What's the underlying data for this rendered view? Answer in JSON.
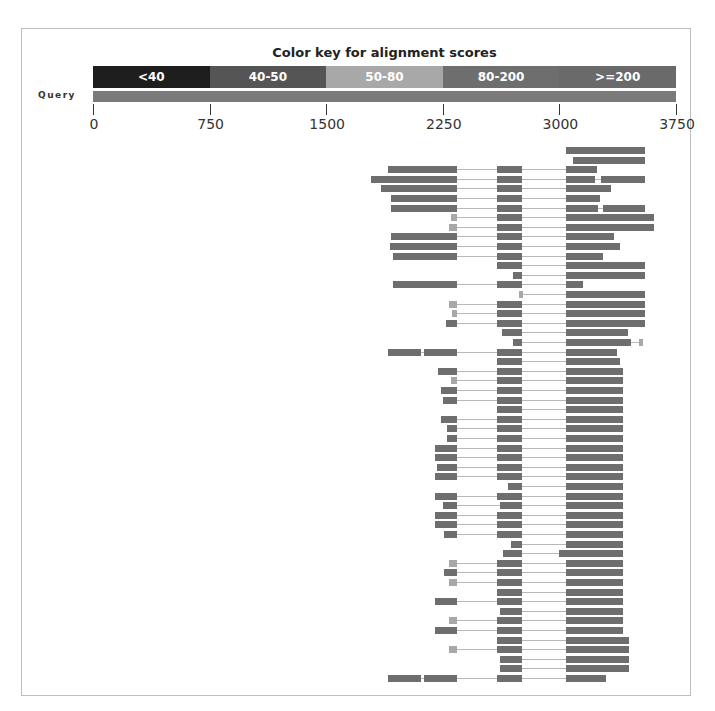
{
  "chart_data": {
    "type": "alignment-graphic",
    "title": "Color key for alignment scores",
    "color_key": [
      {
        "label": "<40",
        "color": "#1e1e1e"
      },
      {
        "label": "40-50",
        "color": "#555555"
      },
      {
        "label": "50-80",
        "color": "#a8a8a8"
      },
      {
        "label": "80-200",
        "color": "#6e6e6e"
      },
      {
        "label": ">=200",
        "color": "#6a6a6a"
      }
    ],
    "query_label": "Query",
    "query_length": 3750,
    "axis_ticks": [
      0,
      750,
      1500,
      2250,
      3000,
      3750
    ],
    "xlim": [
      0,
      3750
    ],
    "hit_count": 56,
    "hits": [
      [
        [
          3040,
          3550
        ]
      ],
      [
        [
          3090,
          3550
        ]
      ],
      [
        [
          1900,
          2340
        ],
        [
          2600,
          2760
        ],
        [
          3040,
          3240
        ]
      ],
      [
        [
          1790,
          2340
        ],
        [
          2600,
          2760
        ],
        [
          3040,
          3230
        ],
        [
          3270,
          3550
        ]
      ],
      [
        [
          1850,
          2340
        ],
        [
          2600,
          2760
        ],
        [
          3040,
          3330
        ]
      ],
      [
        [
          1920,
          2340
        ],
        [
          2600,
          2760
        ],
        [
          3040,
          3260
        ]
      ],
      [
        [
          1920,
          2340
        ],
        [
          2600,
          2760
        ],
        [
          3040,
          3250
        ],
        [
          3280,
          3550
        ]
      ],
      [
        [
          2300,
          2340
        ],
        [
          2600,
          2760
        ],
        [
          3040,
          3610
        ]
      ],
      [
        [
          2290,
          2340
        ],
        [
          2600,
          2760
        ],
        [
          3040,
          3610
        ]
      ],
      [
        [
          1920,
          2340
        ],
        [
          2600,
          2760
        ],
        [
          3040,
          3350
        ]
      ],
      [
        [
          1910,
          2340
        ],
        [
          2600,
          2760
        ],
        [
          3040,
          3390
        ]
      ],
      [
        [
          1930,
          2340
        ],
        [
          2600,
          2760
        ],
        [
          3040,
          3280
        ]
      ],
      [
        [
          2600,
          2760
        ],
        [
          3040,
          3550
        ]
      ],
      [
        [
          2700,
          2760
        ],
        [
          3040,
          3550
        ]
      ],
      [
        [
          1930,
          2340
        ],
        [
          2600,
          2760
        ],
        [
          3040,
          3150
        ]
      ],
      [
        [
          2740,
          2760
        ],
        [
          3040,
          3550
        ]
      ],
      [
        [
          2290,
          2340
        ],
        [
          2600,
          2760
        ],
        [
          3040,
          3550
        ]
      ],
      [
        [
          2310,
          2340
        ],
        [
          2600,
          2760
        ],
        [
          3040,
          3550
        ]
      ],
      [
        [
          2270,
          2340
        ],
        [
          2600,
          2760
        ],
        [
          3040,
          3550
        ]
      ],
      [
        [
          2630,
          2760
        ],
        [
          3040,
          3440
        ]
      ],
      [
        [
          2700,
          2760
        ],
        [
          3040,
          3460
        ],
        [
          3510,
          3530
        ]
      ],
      [
        [
          1900,
          2110
        ],
        [
          2130,
          2340
        ],
        [
          2600,
          2760
        ],
        [
          3040,
          3370
        ]
      ],
      [
        [
          2600,
          2760
        ],
        [
          3040,
          3390
        ]
      ],
      [
        [
          2220,
          2340
        ],
        [
          2600,
          2760
        ],
        [
          3040,
          3410
        ]
      ],
      [
        [
          2300,
          2340
        ],
        [
          2600,
          2760
        ],
        [
          3040,
          3410
        ]
      ],
      [
        [
          2240,
          2340
        ],
        [
          2600,
          2760
        ],
        [
          3040,
          3410
        ]
      ],
      [
        [
          2250,
          2340
        ],
        [
          2600,
          2760
        ],
        [
          3040,
          3410
        ]
      ],
      [
        [
          2600,
          2760
        ],
        [
          3040,
          3410
        ]
      ],
      [
        [
          2240,
          2340
        ],
        [
          2600,
          2760
        ],
        [
          3040,
          3410
        ]
      ],
      [
        [
          2280,
          2340
        ],
        [
          2600,
          2760
        ],
        [
          3040,
          3410
        ]
      ],
      [
        [
          2280,
          2340
        ],
        [
          2600,
          2760
        ],
        [
          3040,
          3410
        ]
      ],
      [
        [
          2200,
          2340
        ],
        [
          2600,
          2760
        ],
        [
          3040,
          3410
        ]
      ],
      [
        [
          2200,
          2340
        ],
        [
          2600,
          2760
        ],
        [
          3040,
          3410
        ]
      ],
      [
        [
          2210,
          2340
        ],
        [
          2600,
          2760
        ],
        [
          3040,
          3410
        ]
      ],
      [
        [
          2200,
          2340
        ],
        [
          2600,
          2760
        ],
        [
          3040,
          3410
        ]
      ],
      [
        [
          2670,
          2760
        ],
        [
          3040,
          3410
        ]
      ],
      [
        [
          2200,
          2340
        ],
        [
          2600,
          2760
        ],
        [
          3040,
          3410
        ]
      ],
      [
        [
          2250,
          2340
        ],
        [
          2620,
          2760
        ],
        [
          3040,
          3410
        ]
      ],
      [
        [
          2200,
          2340
        ],
        [
          2600,
          2760
        ],
        [
          3040,
          3410
        ]
      ],
      [
        [
          2200,
          2340
        ],
        [
          2600,
          2760
        ],
        [
          3040,
          3410
        ]
      ],
      [
        [
          2260,
          2340
        ],
        [
          2600,
          2760
        ],
        [
          3040,
          3410
        ]
      ],
      [
        [
          2690,
          2760
        ],
        [
          3040,
          3410
        ]
      ],
      [
        [
          2640,
          2760
        ],
        [
          3000,
          3410
        ]
      ],
      [
        [
          2290,
          2340
        ],
        [
          2600,
          2760
        ],
        [
          3040,
          3410
        ]
      ],
      [
        [
          2260,
          2340
        ],
        [
          2600,
          2760
        ],
        [
          3040,
          3410
        ]
      ],
      [
        [
          2290,
          2340
        ],
        [
          2600,
          2760
        ],
        [
          3040,
          3410
        ]
      ],
      [
        [
          2600,
          2760
        ],
        [
          3040,
          3410
        ]
      ],
      [
        [
          2200,
          2340
        ],
        [
          2600,
          2760
        ],
        [
          3040,
          3410
        ]
      ],
      [
        [
          2620,
          2760
        ],
        [
          3040,
          3410
        ]
      ],
      [
        [
          2290,
          2340
        ],
        [
          2600,
          2760
        ],
        [
          3040,
          3410
        ]
      ],
      [
        [
          2200,
          2340
        ],
        [
          2600,
          2760
        ],
        [
          3040,
          3410
        ]
      ],
      [
        [
          2600,
          2760
        ],
        [
          3040,
          3450
        ]
      ],
      [
        [
          2290,
          2340
        ],
        [
          2600,
          2760
        ],
        [
          3040,
          3450
        ]
      ],
      [
        [
          2620,
          2760
        ],
        [
          3040,
          3450
        ]
      ],
      [
        [
          2620,
          2760
        ],
        [
          3040,
          3450
        ]
      ],
      [
        [
          1900,
          2110
        ],
        [
          2130,
          2340
        ],
        [
          2600,
          2760
        ],
        [
          3040,
          3300
        ]
      ]
    ]
  }
}
